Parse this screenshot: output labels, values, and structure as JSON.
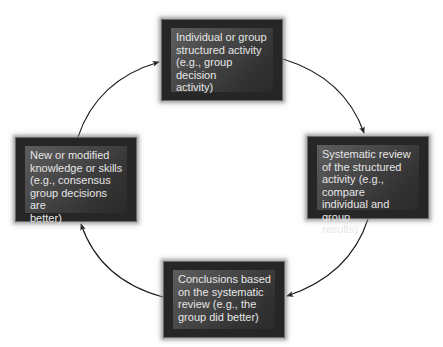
{
  "diagram": {
    "type": "cycle",
    "nodes": [
      {
        "id": "top",
        "label": "Individual or group\nstructured activity\n(e.g., group decision\nactivity)"
      },
      {
        "id": "right",
        "label": "Systematic review\nof the structured\nactivity (e.g., compare\nindividual and group\nresults)"
      },
      {
        "id": "bottom",
        "label": "Conclusions based\non the systematic\nreview (e.g., the\ngroup did better)"
      },
      {
        "id": "left",
        "label": "New or modified\nknowledge or skills\n(e.g., consensus\ngroup decisions are\nbetter)"
      }
    ],
    "edges": [
      {
        "from": "top",
        "to": "right",
        "direction": "clockwise"
      },
      {
        "from": "right",
        "to": "bottom",
        "direction": "clockwise"
      },
      {
        "from": "bottom",
        "to": "left",
        "direction": "clockwise"
      },
      {
        "from": "left",
        "to": "top",
        "direction": "clockwise"
      }
    ],
    "colors": {
      "background": "#ffffff",
      "box_outer": "#262626",
      "box_inner_light": "#5e5e5e",
      "box_inner_dark": "#2a2a2a",
      "box_text": "#e6e6e6",
      "arrow": "#1a1a1a"
    }
  }
}
